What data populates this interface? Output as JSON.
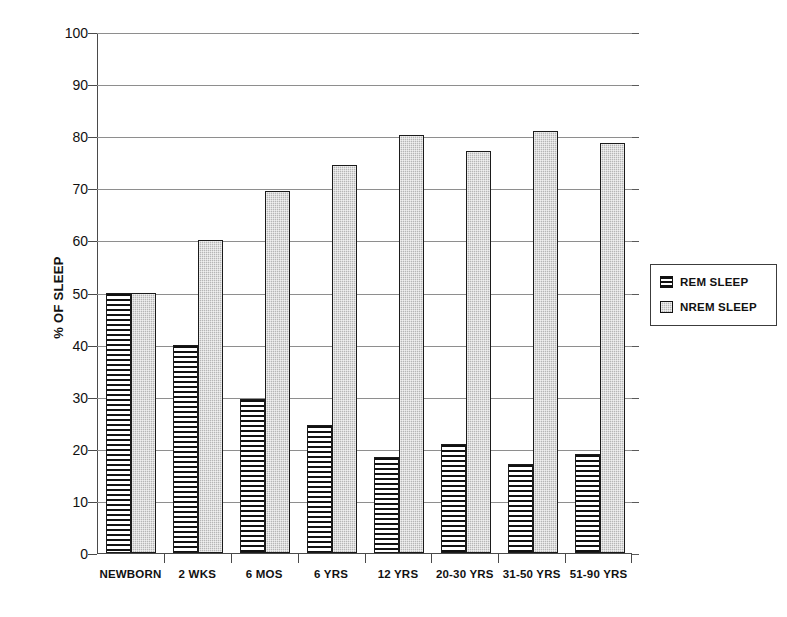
{
  "chart_data": {
    "type": "bar",
    "title": "",
    "xlabel": "",
    "ylabel": "% OF SLEEP",
    "ylim": [
      0,
      100
    ],
    "ytick_labels": [
      "0",
      "10",
      "20",
      "30",
      "40",
      "50",
      "60",
      "70",
      "80",
      "90",
      "100"
    ],
    "ytick_values": [
      0,
      10,
      20,
      30,
      40,
      50,
      60,
      70,
      80,
      90,
      100
    ],
    "grid": true,
    "legend_position": "right",
    "categories": [
      "NEWBORN",
      "2 WKS",
      "6 MOS",
      "6 YRS",
      "12 YRS",
      "20-30 YRS",
      "31-50 YRS",
      "51-90 YRS"
    ],
    "series": [
      {
        "name": "REM SLEEP",
        "pattern": "horizontal-stripes",
        "color": "#ffffff",
        "values": [
          50,
          40,
          29.5,
          24.5,
          18.5,
          21,
          17,
          19
        ]
      },
      {
        "name": "NREM SLEEP",
        "pattern": "gray-stipple",
        "color": "#b6b6b6",
        "values": [
          50,
          60,
          69.5,
          74.5,
          80.3,
          77.2,
          81,
          78.7
        ]
      }
    ]
  },
  "axis": {
    "y_label": "% OF SLEEP"
  },
  "legend": {
    "items": [
      {
        "label": "REM SLEEP",
        "swatch": "rem-pattern-swatch"
      },
      {
        "label": "NREM SLEEP",
        "swatch": "nrem-pattern-swatch"
      }
    ]
  }
}
